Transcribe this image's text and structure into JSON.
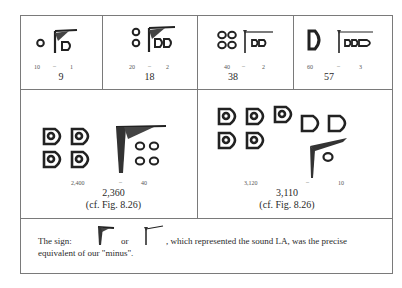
{
  "examples_row1": [
    {
      "left": "10",
      "op": "–",
      "right": "1",
      "result": "9"
    },
    {
      "left": "20",
      "op": "–",
      "right": "2",
      "result": "18"
    },
    {
      "left": "40",
      "op": "–",
      "right": "2",
      "result": "38"
    },
    {
      "left": "60",
      "op": "–",
      "right": "3",
      "result": "57"
    }
  ],
  "examples_row2": [
    {
      "left": "2,400",
      "op": "–",
      "right": "40",
      "result": "2,360",
      "ref": "(cf. Fig. 8.26)"
    },
    {
      "left": "3,120",
      "op": "–",
      "right": "10",
      "result": "3,110",
      "ref": "(cf. Fig. 8.26)"
    }
  ],
  "note": {
    "prefix": "The sign:",
    "or": "or",
    "suffix": ", which represented the sound LA, was the precise",
    "line2": "equivalent of our \"minus\"."
  }
}
